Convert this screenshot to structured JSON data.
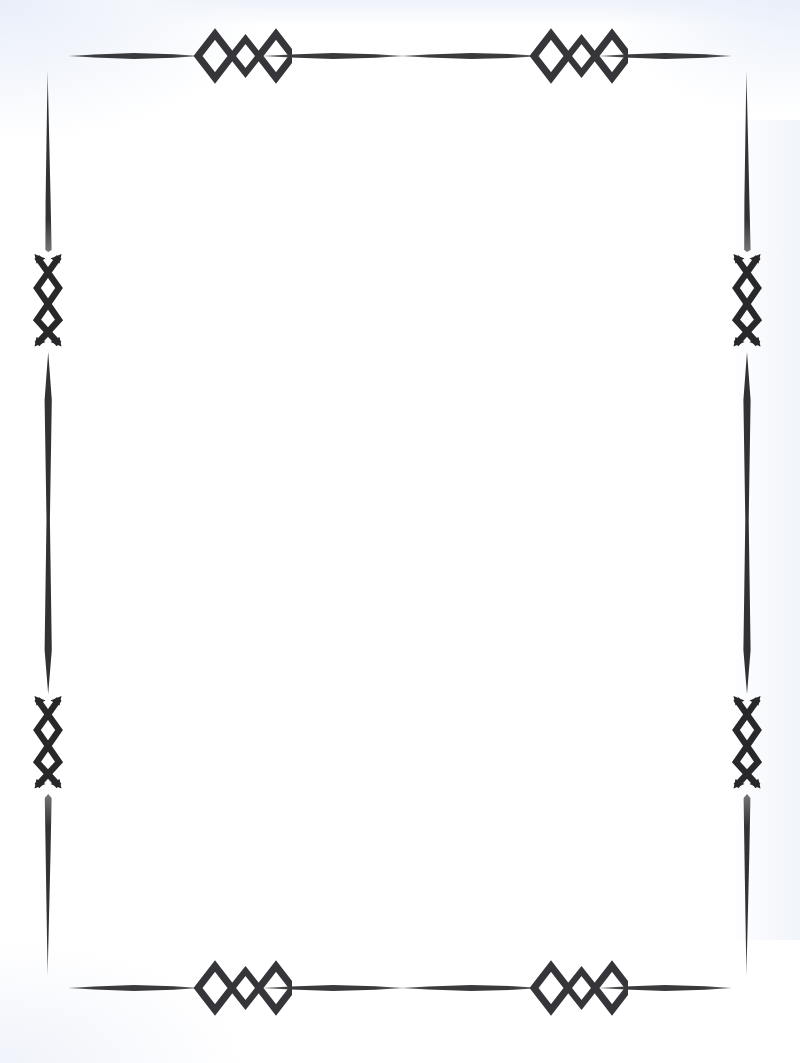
{
  "document": {
    "type": "decorative-page-border",
    "title": "Ornamental Diamond Frame",
    "page_width": 800,
    "page_height": 1063,
    "body_text": "",
    "content_area": {
      "left": 72,
      "top": 72,
      "width": 656,
      "height": 916
    }
  },
  "colors": {
    "ink": "#3a3a3c",
    "ink_dark": "#2e2e30",
    "ink_soft": "#555559",
    "paper": "#ffffff",
    "scan_tint": "#eef2fa"
  },
  "frame": {
    "style": "open-corner tapered rule with diamond motifs",
    "corner_style": "open",
    "stroke_taper": "spindle",
    "borders": {
      "top": {
        "name": "top-border",
        "y": 56,
        "x_start": 68,
        "x_end": 732,
        "segments": 4,
        "ornaments": 2
      },
      "bottom": {
        "name": "bottom-border",
        "y": 988,
        "x_start": 68,
        "x_end": 732,
        "segments": 4,
        "ornaments": 2
      },
      "left": {
        "name": "left-border",
        "x": 48,
        "y_start": 70,
        "y_end": 976,
        "segments": 3,
        "ornaments": 2
      },
      "right": {
        "name": "right-border",
        "x": 746,
        "y_start": 70,
        "y_end": 976,
        "segments": 3,
        "ornaments": 2
      }
    },
    "horizontal_ornament": {
      "name": "diamond-trio-ornament",
      "description": "three outlined diamonds, large-small-large",
      "diamond_count": 3,
      "large_half_width": 26,
      "large_half_height": 26,
      "small_half_width": 19,
      "small_half_height": 19,
      "stroke_width": 8,
      "positions_top": [
        232,
        568
      ],
      "positions_bottom": [
        232,
        568
      ]
    },
    "vertical_ornament": {
      "name": "crossed-diamond-ornament",
      "description": "elongated X with a central diamond and flared arrow tips",
      "half_height": 48,
      "half_width": 15,
      "stroke_width": 7,
      "positions_left": [
        300,
        742
      ],
      "positions_right": [
        300,
        742
      ]
    }
  }
}
